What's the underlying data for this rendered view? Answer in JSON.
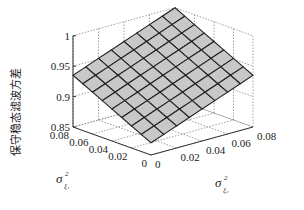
{
  "chart_data": {
    "type": "surface",
    "title": "",
    "xlabel": {
      "symbol": "σ",
      "sup": "2",
      "sub": "ξ₂"
    },
    "ylabel": {
      "symbol": "σ",
      "sup": "2",
      "sub": "ξ₁"
    },
    "zlabel": "保守稳态滤波方差",
    "xlim": [
      0,
      0.08
    ],
    "ylim": [
      0,
      0.08
    ],
    "zlim": [
      0.85,
      1.0
    ],
    "x_ticks": [
      "0",
      "0.02",
      "0.04",
      "0.06",
      "0.08"
    ],
    "y_ticks": [
      "0",
      "0.02",
      "0.04",
      "0.06",
      "0.08"
    ],
    "z_ticks": [
      "0.85",
      "0.9",
      "0.95",
      "1"
    ],
    "x_tick_values": [
      0,
      0.02,
      0.04,
      0.06,
      0.08
    ],
    "y_tick_values": [
      0,
      0.02,
      0.04,
      0.06,
      0.08
    ],
    "z_tick_values": [
      0.85,
      0.9,
      0.95,
      1.0
    ],
    "grid": true,
    "grid_x": [
      0,
      0.01,
      0.02,
      0.03,
      0.04,
      0.05,
      0.06,
      0.07,
      0.08
    ],
    "grid_y": [
      0,
      0.01,
      0.02,
      0.03,
      0.04,
      0.05,
      0.06,
      0.07,
      0.08
    ],
    "surface_model": "plane",
    "z_at_corners": {
      "x0_y0": 0.87,
      "x008_y0": 0.935,
      "x0_y008": 0.935,
      "x008_y008": 1.0
    },
    "surface_color": "#c8c8c8",
    "edge_color": "#222222"
  }
}
